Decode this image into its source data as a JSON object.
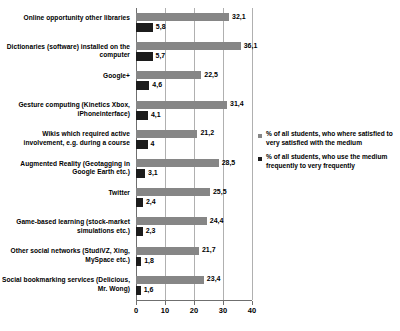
{
  "chart_data": {
    "type": "bar",
    "orientation": "horizontal",
    "title": "",
    "xlabel": "",
    "ylabel": "",
    "xlim": [
      0,
      40
    ],
    "xticks": [
      0,
      10,
      20,
      30,
      40
    ],
    "grid": true,
    "legend_position": "right",
    "categories": [
      "Online opportunity  other libraries",
      "Dictionaries (software) installed on the computer",
      "Google+",
      "Gesture computing (Kinetics Xbox, iPhoneinterface)",
      "Wikis which required active involvement, e.g. during a course",
      "Augmented Reality (Geotagging in Google Earth etc.)",
      "Twitter",
      "Game-based learning (stock-market simulations etc.)",
      "Other social networks (StudiVZ, Xing, MySpace etc.)",
      "Social bookmarking services (Delicious, Mr. Wong)"
    ],
    "series": [
      {
        "name": "% of all students, who where satisfied to very satisfied with the medium",
        "color": "#868686",
        "values": [
          32.1,
          36.1,
          22.5,
          31.4,
          21.2,
          28.5,
          25.5,
          24.4,
          21.7,
          23.4
        ],
        "labels": [
          "32,1",
          "36,1",
          "22,5",
          "31,4",
          "21,2",
          "28,5",
          "25,5",
          "24,4",
          "21,7",
          "23,4"
        ]
      },
      {
        "name": "% of all students, who use the medium frequently to very frequently",
        "color": "#1c1c1c",
        "values": [
          5.8,
          5.7,
          4.6,
          4.1,
          4.0,
          3.1,
          2.4,
          2.3,
          1.8,
          1.6
        ],
        "labels": [
          "5,8",
          "5,7",
          "4,6",
          "4,1",
          "4",
          "3,1",
          "2,4",
          "2,3",
          "1,8",
          "1,6"
        ]
      }
    ]
  },
  "legend": {
    "items": [
      {
        "label": "% of all students, who where satisfied to very satisfied with the medium",
        "color": "#868686"
      },
      {
        "label": "% of all students, who use the medium frequently to very frequently",
        "color": "#1c1c1c"
      }
    ]
  }
}
